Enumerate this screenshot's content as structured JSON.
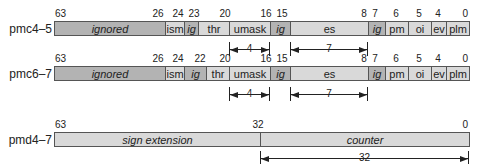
{
  "colors": {
    "light_field": "#d9d9d9",
    "dark_field": "#b3b3b3",
    "border": "#555555",
    "text": "#222222"
  },
  "registers": [
    {
      "name": "pmc4–5",
      "bit_labels": [
        "63",
        "26",
        "24",
        "23",
        "20",
        "16",
        "15",
        "8",
        "7",
        "6",
        "5",
        "4",
        "0"
      ],
      "fields": [
        {
          "label": "ignored",
          "italic": true,
          "shade": "dark"
        },
        {
          "label": "ism",
          "italic": false,
          "shade": "light"
        },
        {
          "label": "ig",
          "italic": true,
          "shade": "dark"
        },
        {
          "label": "thr",
          "italic": false,
          "shade": "light"
        },
        {
          "label": "umask",
          "italic": false,
          "shade": "light"
        },
        {
          "label": "ig",
          "italic": true,
          "shade": "dark"
        },
        {
          "label": "es",
          "italic": false,
          "shade": "light"
        },
        {
          "label": "ig",
          "italic": true,
          "shade": "dark"
        },
        {
          "label": "pm",
          "italic": false,
          "shade": "light"
        },
        {
          "label": "oi",
          "italic": false,
          "shade": "light"
        },
        {
          "label": "ev",
          "italic": false,
          "shade": "light"
        },
        {
          "label": "plm",
          "italic": false,
          "shade": "light"
        }
      ],
      "dimensions": [
        {
          "field": "umask",
          "width": "4"
        },
        {
          "field": "es",
          "width": "7"
        }
      ]
    },
    {
      "name": "pmc6–7",
      "bit_labels": [
        "63",
        "26",
        "24",
        "22",
        "20",
        "16",
        "15",
        "8",
        "7",
        "6",
        "5",
        "4",
        "0"
      ],
      "fields": [
        {
          "label": "ignored",
          "italic": true,
          "shade": "dark"
        },
        {
          "label": "ism",
          "italic": false,
          "shade": "light"
        },
        {
          "label": "ig",
          "italic": true,
          "shade": "dark"
        },
        {
          "label": "thr",
          "italic": false,
          "shade": "light"
        },
        {
          "label": "umask",
          "italic": false,
          "shade": "light"
        },
        {
          "label": "ig",
          "italic": true,
          "shade": "dark"
        },
        {
          "label": "es",
          "italic": false,
          "shade": "light"
        },
        {
          "label": "ig",
          "italic": true,
          "shade": "dark"
        },
        {
          "label": "pm",
          "italic": false,
          "shade": "light"
        },
        {
          "label": "oi",
          "italic": false,
          "shade": "light"
        },
        {
          "label": "ev",
          "italic": false,
          "shade": "light"
        },
        {
          "label": "plm",
          "italic": false,
          "shade": "light"
        }
      ],
      "dimensions": [
        {
          "field": "umask",
          "width": "4"
        },
        {
          "field": "es",
          "width": "7"
        }
      ]
    },
    {
      "name": "pmd4–7",
      "bit_labels": [
        "63",
        "32",
        "0"
      ],
      "fields": [
        {
          "label": "sign extension",
          "italic": true,
          "shade": "light"
        },
        {
          "label": "counter",
          "italic": true,
          "shade": "light"
        }
      ],
      "dimensions": [
        {
          "field": "counter",
          "width": "32"
        }
      ]
    }
  ]
}
